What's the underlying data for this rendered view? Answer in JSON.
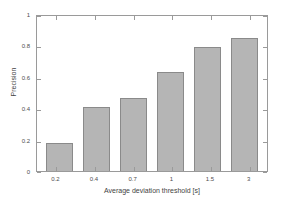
{
  "chart_data": {
    "type": "bar",
    "title": "",
    "xlabel": "Average deviation threshold [s]",
    "ylabel": "Precision",
    "categories": [
      "0.2",
      "0.4",
      "0.7",
      "1",
      "1.5",
      "3"
    ],
    "values": [
      0.18,
      0.41,
      0.465,
      0.63,
      0.79,
      0.85
    ],
    "series": [
      {
        "name": "Precision",
        "values": [
          0.18,
          0.41,
          0.465,
          0.63,
          0.79,
          0.85
        ]
      }
    ],
    "ylim": [
      0,
      1
    ],
    "yticks": [
      "0",
      "0.2",
      "0.4",
      "0.6",
      "0.8",
      "1"
    ],
    "ytick_values": [
      0,
      0.2,
      0.4,
      0.6,
      0.8,
      1
    ],
    "xticks": [
      "0.2",
      "0.4",
      "0.7",
      "1",
      "1.5",
      "3"
    ],
    "grid": false,
    "legend": null,
    "legend_position": "none",
    "bar_fill_color": "#b5b5b5",
    "bar_edge_color": "#8a8a8a",
    "axis_color": "#9a9a9a",
    "background_color": "#ffffff",
    "text_color": "#4d4d4d"
  }
}
